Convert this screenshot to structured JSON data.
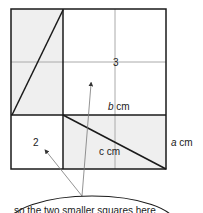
{
  "diagram": {
    "labels": {
      "region_3": "3",
      "region_2": "2",
      "b": "b",
      "b_unit": " cm",
      "c_label": "c cm",
      "a": "a",
      "a_unit": " cm",
      "callout": "so the two smaller squares here"
    },
    "colors": {
      "shade": "#efefef",
      "line": "#1a1a1a",
      "grid": "#aaaaaa",
      "arrow": "#777777"
    }
  }
}
